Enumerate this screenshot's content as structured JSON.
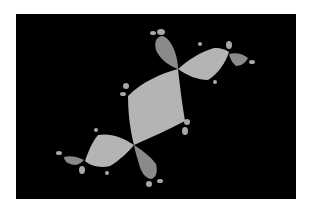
{
  "image": {
    "subject": "Julia set fractal",
    "background_color": "#ffffff",
    "frame_color": "#000000",
    "colors": {
      "primary_lobe": "#b4b4b4",
      "secondary_lobe": "#8a8a8a",
      "bud": "#a8a8a8"
    }
  }
}
